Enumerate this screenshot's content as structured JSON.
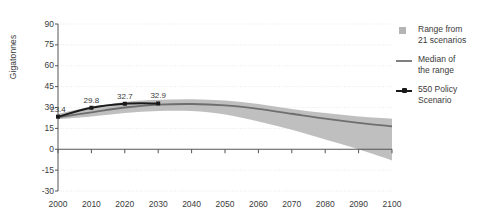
{
  "chart_data": {
    "type": "area",
    "title": "",
    "xlabel": "",
    "ylabel": "Gigatonnes",
    "xlim": [
      2000,
      2100
    ],
    "ylim": [
      -30,
      90
    ],
    "grid": true,
    "legend_position": "right",
    "x_ticks": [
      "2000",
      "2010",
      "2020",
      "2030",
      "2040",
      "2050",
      "2060",
      "2070",
      "2080",
      "2090",
      "2100"
    ],
    "y_ticks": [
      "90",
      "75",
      "60",
      "45",
      "30",
      "15",
      "0",
      "-15",
      "-30"
    ],
    "x": [
      2000,
      2010,
      2020,
      2030,
      2040,
      2050,
      2060,
      2070,
      2080,
      2090,
      2100
    ],
    "series": [
      {
        "name": "Range from 21 scenarios",
        "type": "band",
        "upper": [
          25.5,
          30.5,
          34.0,
          35.5,
          36.0,
          35.0,
          32.5,
          29.0,
          26.0,
          23.5,
          22.0
        ],
        "lower": [
          21.5,
          23.5,
          26.0,
          27.5,
          27.5,
          25.0,
          20.0,
          14.0,
          7.0,
          0.0,
          -8.0
        ],
        "color": "#b4b4b4"
      },
      {
        "name": "Median of the range",
        "type": "line",
        "values": [
          23.0,
          26.5,
          30.0,
          32.0,
          32.5,
          31.5,
          29.0,
          25.5,
          22.0,
          19.0,
          16.5
        ],
        "color": "#6e6e6e"
      },
      {
        "name": "550 Policy Scenario",
        "type": "line-marker",
        "x": [
          2000,
          2010,
          2020,
          2030
        ],
        "values": [
          23.4,
          29.8,
          32.7,
          32.9
        ],
        "labels": [
          "23.4",
          "29.8",
          "32.7",
          "32.9"
        ],
        "color": "#1a1a1a"
      }
    ]
  },
  "axis": {
    "y_title": "Gigatonnes"
  },
  "legend": {
    "items": [
      {
        "marker": "range-swatch",
        "line1": "Range from",
        "line2": "21 scenarios"
      },
      {
        "marker": "median-line",
        "line1": "Median of",
        "line2": "the range"
      },
      {
        "marker": "policy-line-marker",
        "line1": "550 Policy",
        "line2": "Scenario"
      }
    ]
  }
}
